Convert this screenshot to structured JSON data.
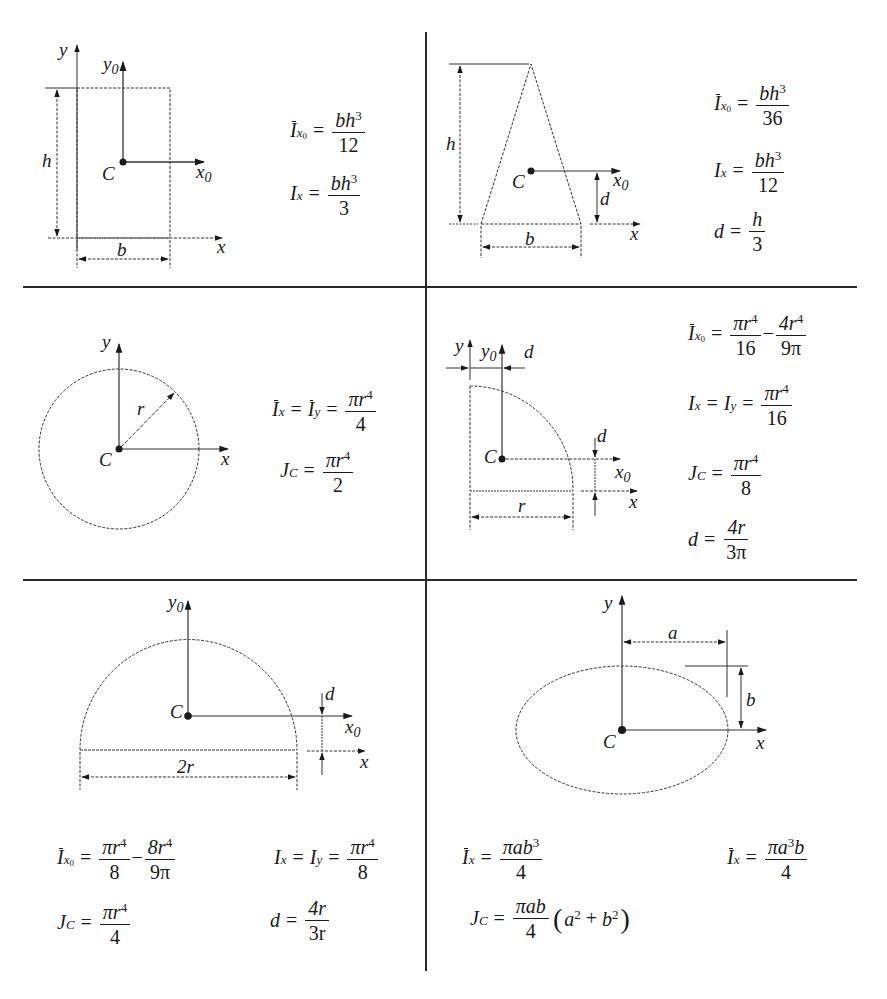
{
  "colors": {
    "ink": "#1a1a1a",
    "rule": "#2a2a2a",
    "background": "#ffffff"
  },
  "panels": [
    {
      "id": "rectangle",
      "shape": "rectangle",
      "labels": {
        "y": "y",
        "y0": "y",
        "y0_sub": "0",
        "x": "x",
        "x0": "x",
        "x0_sub": "0",
        "C": "C",
        "h": "h",
        "b": "b"
      },
      "formulas": [
        {
          "lhs": "I",
          "lhs_sub": "x",
          "lhs_subsub": "0",
          "bar": true,
          "num": "bh",
          "num_sup": "3",
          "den": "12"
        },
        {
          "lhs": "I",
          "lhs_sub": "x",
          "bar": false,
          "num": "bh",
          "num_sup": "3",
          "den": "3"
        }
      ]
    },
    {
      "id": "triangle",
      "shape": "triangle",
      "labels": {
        "x": "x",
        "x0": "x",
        "x0_sub": "0",
        "C": "C",
        "h": "h",
        "b": "b",
        "d": "d"
      },
      "formulas": [
        {
          "lhs": "I",
          "lhs_sub": "x",
          "lhs_subsub": "0",
          "bar": true,
          "num": "bh",
          "num_sup": "3",
          "den": "36"
        },
        {
          "lhs": "I",
          "lhs_sub": "x",
          "bar": false,
          "num": "bh",
          "num_sup": "3",
          "den": "12"
        },
        {
          "lhs": "d",
          "num": "h",
          "den": "3"
        }
      ]
    },
    {
      "id": "circle",
      "shape": "circle",
      "labels": {
        "y": "y",
        "x": "x",
        "C": "C",
        "r": "r"
      },
      "formulas": [
        {
          "lhs": "I",
          "lhs_sub": "x",
          "bar": true,
          "mid": "I",
          "mid_sub": "y",
          "num": "πr",
          "num_sup": "4",
          "den": "4"
        },
        {
          "lhs": "J",
          "lhs_sub": "C",
          "num": "πr",
          "num_sup": "4",
          "den": "2"
        }
      ]
    },
    {
      "id": "quarter-circle",
      "shape": "quarter circle",
      "labels": {
        "y": "y",
        "y0": "y",
        "y0_sub": "0",
        "d_top": "d",
        "d_side": "d",
        "C": "C",
        "x0": "x",
        "x0_sub": "0",
        "x": "x",
        "r": "r"
      },
      "formulas": [
        {
          "lhs": "I",
          "lhs_sub": "x",
          "lhs_subsub": "0",
          "bar": true,
          "num": "πr",
          "num_sup": "4",
          "den": "16",
          "minus": "−",
          "num2": "4r",
          "num2_sup": "4",
          "den2": "9π"
        },
        {
          "lhs": "I",
          "lhs_sub": "x",
          "mid": "I",
          "mid_sub": "y",
          "num": "πr",
          "num_sup": "4",
          "den": "16"
        },
        {
          "lhs": "J",
          "lhs_sub": "C",
          "num": "πr",
          "num_sup": "4",
          "den": "8"
        },
        {
          "lhs": "d",
          "num": "4r",
          "den": "3π"
        }
      ]
    },
    {
      "id": "semicircle",
      "shape": "semicircle",
      "labels": {
        "y0": "y",
        "y0_sub": "0",
        "C": "C",
        "d": "d",
        "x0": "x",
        "x0_sub": "0",
        "x": "x",
        "two_r": "2r"
      },
      "formulas": [
        {
          "lhs": "I",
          "lhs_sub": "x",
          "lhs_subsub": "0",
          "bar": true,
          "num": "πr",
          "num_sup": "4",
          "den": "8",
          "minus": "−",
          "num2": "8r",
          "num2_sup": "4",
          "den2": "9π"
        },
        {
          "lhs": "I",
          "lhs_sub": "x",
          "mid": "I",
          "mid_sub": "y",
          "num": "πr",
          "num_sup": "4",
          "den": "8"
        },
        {
          "lhs": "J",
          "lhs_sub": "C",
          "num": "πr",
          "num_sup": "4",
          "den": "4"
        },
        {
          "lhs": "d",
          "num": "4r",
          "den": "3r"
        }
      ]
    },
    {
      "id": "ellipse",
      "shape": "ellipse",
      "labels": {
        "y": "y",
        "a": "a",
        "b": "b",
        "C": "C",
        "x": "x"
      },
      "formulas": [
        {
          "lhs": "I",
          "lhs_sub": "x",
          "bar": true,
          "num": "πab",
          "num_sup": "3",
          "den": "4"
        },
        {
          "lhs": "I",
          "lhs_sub": "x",
          "bar": true,
          "num": "πa",
          "num_sup": "3",
          "num_tail": "b",
          "den": "4"
        },
        {
          "lhs": "J",
          "lhs_sub": "C",
          "num": "πab",
          "den": "4",
          "paren_open": "(",
          "paren_body_a": "a",
          "paren_sup_a": "2",
          "plus": "+",
          "paren_body_b": "b",
          "paren_sup_b": "2",
          "paren_close": ")"
        }
      ]
    }
  ],
  "symbols": {
    "equals": "="
  }
}
